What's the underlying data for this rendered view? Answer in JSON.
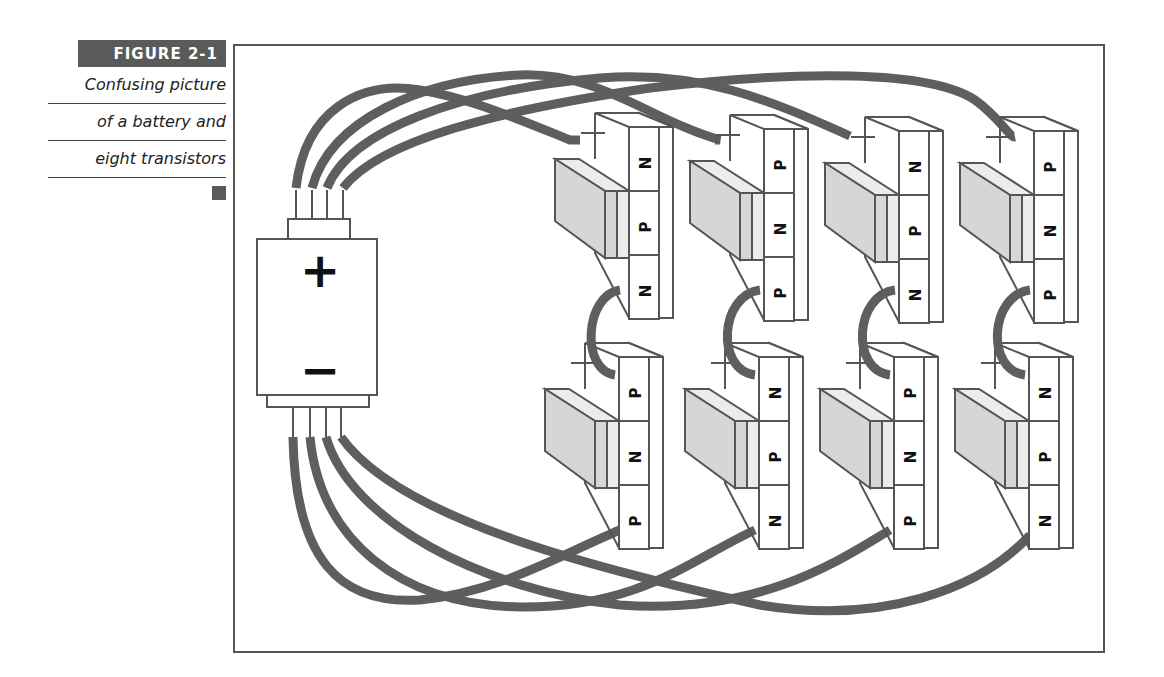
{
  "figure": {
    "label": "FIGURE 2-1",
    "caption_lines": [
      "Confusing picture",
      "of a battery and",
      "eight transistors"
    ]
  },
  "battery": {
    "positive_symbol": "+",
    "negative_symbol": "−",
    "top_leads": 4,
    "bottom_leads": 4
  },
  "transistors": {
    "top_row": [
      {
        "layers": [
          "N",
          "P",
          "N"
        ]
      },
      {
        "layers": [
          "P",
          "N",
          "P"
        ]
      },
      {
        "layers": [
          "N",
          "P",
          "N"
        ]
      },
      {
        "layers": [
          "P",
          "N",
          "P"
        ]
      }
    ],
    "bottom_row": [
      {
        "layers": [
          "P",
          "N",
          "P"
        ]
      },
      {
        "layers": [
          "N",
          "P",
          "N"
        ]
      },
      {
        "layers": [
          "P",
          "N",
          "P"
        ]
      },
      {
        "layers": [
          "N",
          "P",
          "N"
        ]
      }
    ]
  },
  "colors": {
    "wire": "#5e5e5e",
    "outline": "#555555",
    "shaded_block": "#d6d6d6",
    "light_block": "#ececec",
    "label_bg": "#5a5a5a"
  }
}
